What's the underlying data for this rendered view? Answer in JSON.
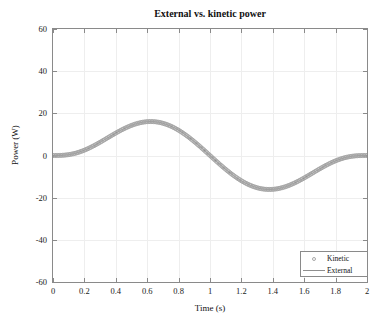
{
  "figure": {
    "title": "External vs. kinetic power",
    "background_color": "#ffffff",
    "axis_color": "#8a8a8a",
    "grid_color": "#eeeeee",
    "series_color": "#a6a6a6"
  },
  "axes": {
    "x_title": "Time (s)",
    "y_title": "Power (W)",
    "x_ticks": [
      "0",
      "0.2",
      "0.4",
      "0.6",
      "0.8",
      "1",
      "1.2",
      "1.4",
      "1.6",
      "1.8",
      "2"
    ],
    "y_ticks": [
      "60",
      "40",
      "20",
      "0",
      "-20",
      "-40",
      "-60"
    ]
  },
  "legend": {
    "items": [
      {
        "label": "Kinetic",
        "marker": "circle-marker",
        "color": "#a6a6a6"
      },
      {
        "label": "External",
        "marker": "line-marker",
        "color": "#8f8f8f"
      }
    ]
  },
  "chart_data": {
    "type": "line",
    "title": "External vs. kinetic power",
    "xlabel": "Time (s)",
    "ylabel": "Power (W)",
    "xlim": [
      0,
      2
    ],
    "ylim": [
      -60,
      60
    ],
    "xticks": [
      0,
      0.2,
      0.4,
      0.6,
      0.8,
      1,
      1.2,
      1.4,
      1.6,
      1.8,
      2
    ],
    "yticks": [
      -60,
      -40,
      -20,
      0,
      20,
      40,
      60
    ],
    "grid": true,
    "legend_position": "lower right",
    "series": [
      {
        "name": "Kinetic",
        "style": "circle markers",
        "color": "#a6a6a6",
        "x": [
          0,
          0.05,
          0.1,
          0.15,
          0.2,
          0.25,
          0.3,
          0.35,
          0.4,
          0.45,
          0.5,
          0.55,
          0.6,
          0.65,
          0.6667,
          0.7,
          0.75,
          0.8,
          0.85,
          0.9,
          0.95,
          1.0,
          1.05,
          1.1,
          1.15,
          1.2,
          1.25,
          1.3,
          1.3333,
          1.35,
          1.4,
          1.45,
          1.5,
          1.55,
          1.6,
          1.65,
          1.7,
          1.75,
          1.8,
          1.85,
          1.9,
          1.95,
          2.0
        ],
        "y": [
          0,
          0.42,
          1.62,
          3.43,
          5.67,
          8.13,
          10.62,
          12.95,
          14.93,
          16.41,
          17.23,
          17.27,
          16.43,
          14.64,
          13.83,
          11.85,
          8.08,
          3.37,
          -2.22,
          -8.53,
          -15.36,
          -22.5,
          -29.7,
          -36.7,
          -43.2,
          -48.9,
          -53.4,
          -56.4,
          -57.1,
          -57.2,
          -55.6,
          -51.6,
          -45.0,
          -35.8,
          -24.3,
          -11.1,
          2.97,
          16.8,
          29.1,
          38.5,
          43.9,
          44.4,
          39.4
        ]
      },
      {
        "name": "External",
        "style": "solid line",
        "color": "#8f8f8f",
        "description": "P(t) = 50 * sin(3*pi*t/2) shaped minimum-jerk power profile; peak +50 W at t=0.67 s, zero crossing at t=1.0 s, trough -50 W at t=1.33 s, returns to 0 W at t=2.0 s",
        "x": [
          0,
          0.0667,
          0.1333,
          0.2,
          0.2667,
          0.3333,
          0.4,
          0.4667,
          0.5333,
          0.6,
          0.6667,
          0.7333,
          0.8,
          0.8667,
          0.9333,
          1.0,
          1.0667,
          1.1333,
          1.2,
          1.2667,
          1.3333,
          1.4,
          1.4667,
          1.5333,
          1.6,
          1.6667,
          1.7333,
          1.8,
          1.8667,
          1.9333,
          2.0
        ],
        "y": [
          0,
          0.6,
          2.6,
          6.2,
          11.8,
          19.2,
          27.7,
          36.2,
          43.6,
          48.5,
          50.0,
          47.6,
          41.3,
          31.8,
          19.9,
          6.6,
          -6.6,
          -19.9,
          -31.8,
          -41.3,
          -47.6,
          -50.0,
          -48.5,
          -43.6,
          -36.2,
          -27.7,
          -19.2,
          -11.8,
          -6.2,
          -2.6,
          0.0
        ]
      }
    ]
  }
}
